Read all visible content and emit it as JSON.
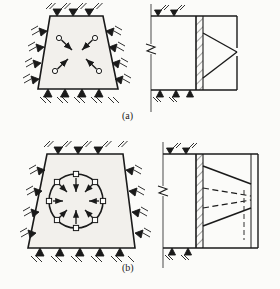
{
  "figure": {
    "background_color": "#fbfbf9",
    "line_color": "#1a1a1a",
    "fill_color": "#f2f0ec",
    "captions": {
      "a": "(a)",
      "b": "(b)"
    },
    "panels": [
      {
        "id": "panel-a-plan",
        "label": "(a)",
        "view": "plan",
        "shape": "trapezoid",
        "description": "Plan view of trapezoidal braced excavation with four inward strut loads",
        "supports": "hatched ground anchors on all four edges",
        "load_arrows": 4,
        "arrow_direction": "inward toward center",
        "marker_shape": "circle"
      },
      {
        "id": "panel-a-section",
        "label": "(a)",
        "view": "section",
        "description": "Section view with hatched wall and triangular pressure distribution",
        "pressure_shape": "triangular",
        "pressure_apex": "mid-height at right",
        "break_symbol": true,
        "dashed_lines": 0,
        "solid_lines": 2
      },
      {
        "id": "panel-b-plan",
        "label": "(b)",
        "view": "plan",
        "shape": "trapezoid",
        "description": "Plan view of trapezoidal braced excavation with circular ring beam and eight radial inward loads",
        "supports": "hatched ground anchors on all four edges",
        "load_arrows": 8,
        "arrow_direction": "radially inward",
        "marker_shape": "square",
        "ring": "circle"
      },
      {
        "id": "panel-b-section",
        "label": "(b)",
        "view": "section",
        "description": "Section view with hatched wall and trapezoidal pressure distribution with dashed alternates",
        "pressure_shape": "trapezoidal",
        "break_symbol": true,
        "dashed_lines": 2,
        "solid_lines": 2
      }
    ],
    "geometry": {
      "plan_a_trapezoid": [
        [
          50,
          16
        ],
        [
          103,
          16
        ],
        [
          118,
          89
        ],
        [
          38,
          89
        ]
      ],
      "plan_b_trapezoid": [
        [
          47,
          154
        ],
        [
          123,
          154
        ],
        [
          135,
          248
        ],
        [
          28,
          248
        ]
      ],
      "section_a_rect": {
        "x": 196,
        "y": 16,
        "w": 41,
        "h": 74
      },
      "section_b_rect": {
        "x": 196,
        "y": 154,
        "w": 62,
        "h": 94
      },
      "circle_b": {
        "cx": 76,
        "cy": 201,
        "r": 27
      }
    }
  }
}
